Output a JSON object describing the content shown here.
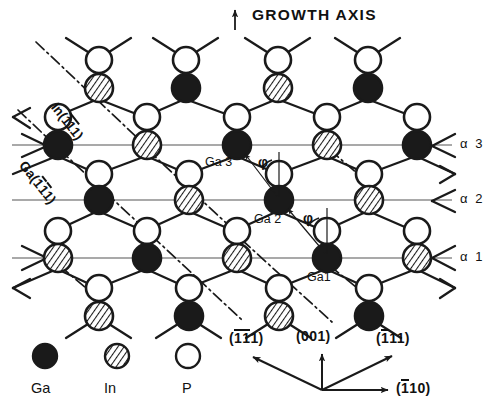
{
  "figure": {
    "title": "GROWTH AXIS",
    "growth_axis_arrow": "up-arrow"
  },
  "plane_labels": [
    {
      "name": "alpha-3",
      "text": "α 3",
      "y": 145
    },
    {
      "name": "alpha-2",
      "text": "α 2",
      "y": 200
    },
    {
      "name": "alpha-1",
      "text": "α 1",
      "y": 258
    }
  ],
  "atom_labels": [
    {
      "name": "ga3-label",
      "text": "Ga 3"
    },
    {
      "name": "ga2-label",
      "text": "Ga 2"
    },
    {
      "name": "ga1-label",
      "text": "Ga1"
    }
  ],
  "angle_markers": [
    {
      "name": "phi-upper",
      "text": "φ"
    },
    {
      "name": "phi-lower",
      "text": "φ"
    }
  ],
  "plane_annotations": [
    {
      "name": "in-plane-label",
      "prefix": "In(",
      "bar": "11",
      "suffix": "1)",
      "full": "In(111)"
    },
    {
      "name": "ga-plane-label",
      "prefix": "Ga(",
      "bar": "1",
      "mid": "1",
      "suffix": "1)",
      "full": "Ga(111)"
    }
  ],
  "legend": {
    "items": [
      {
        "name": "legend-ga",
        "symbol": "filled-circle",
        "label": "Ga",
        "color": "#1a1a1a"
      },
      {
        "name": "legend-in",
        "symbol": "hatched-circle",
        "label": "In",
        "color": "#ffffff"
      },
      {
        "name": "legend-p",
        "symbol": "open-circle",
        "label": "P",
        "color": "#ffffff"
      }
    ]
  },
  "directions": {
    "items": [
      {
        "name": "dir-1bar1bar1",
        "text": "(1̄1̄1)",
        "display": "(111)",
        "bars": [
          0,
          1
        ],
        "angle_deg": 135
      },
      {
        "name": "dir-001",
        "text": "(001)",
        "display": "(001)",
        "bars": [],
        "angle_deg": 90
      },
      {
        "name": "dir-1bar11",
        "text": "(̄1 1 1)",
        "display": "(111)",
        "bars": [
          0
        ],
        "angle_deg": 45
      },
      {
        "name": "dir-1bar10",
        "text": "(̄1 1 0)",
        "display": "(110)",
        "bars": [
          0
        ],
        "angle_deg": 0
      }
    ]
  },
  "colors": {
    "stroke": "#1a1a1a",
    "ga_fill": "#1a1a1a",
    "in_fill": "#ffffff",
    "p_fill": "#ffffff",
    "plane_line": "#555555",
    "background": "#ffffff"
  }
}
